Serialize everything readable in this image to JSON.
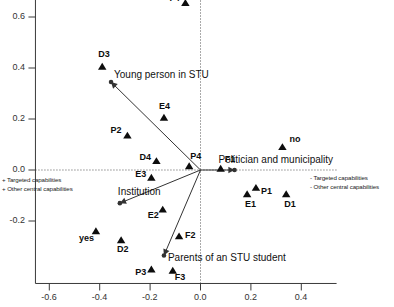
{
  "chart_data": {
    "type": "scatter",
    "title": "",
    "xlabel": "'Whom is in focus' and discourse on capabilities",
    "ylabel": "",
    "xlim": [
      -0.72,
      0.56
    ],
    "ylim": [
      -0.32,
      0.72
    ],
    "xticks": [
      -0.6,
      -0.4,
      -0.2,
      0.0,
      0.2,
      0.4
    ],
    "xtick_labels": [
      "-0.6",
      "-0.4",
      "-0.2",
      "0.0",
      "0.2",
      "0.4"
    ],
    "yticks": [
      0.6,
      0.4,
      0.2,
      0.0,
      -0.2
    ],
    "ytick_labels": [
      "0.6",
      "0.4",
      "0.2",
      "0.0",
      "-0.2"
    ],
    "grid": false,
    "reference_lines": {
      "x": 0.0,
      "y": 0.0,
      "style": "dotted"
    },
    "marker": "triangle",
    "points": [
      {
        "label": "F4",
        "x": -0.06,
        "y": 0.655,
        "label_dx": -16,
        "label_dy": -5
      },
      {
        "label": "D3",
        "x": -0.39,
        "y": 0.405,
        "label_dx": -4,
        "label_dy": -13
      },
      {
        "label": "E4",
        "x": -0.145,
        "y": 0.205,
        "label_dx": -5,
        "label_dy": -12
      },
      {
        "label": "P2",
        "x": -0.29,
        "y": 0.135,
        "label_dx": -17,
        "label_dy": -6
      },
      {
        "label": "no",
        "x": 0.325,
        "y": 0.09,
        "label_dx": 7,
        "label_dy": -8
      },
      {
        "label": "D4",
        "x": -0.175,
        "y": 0.035,
        "label_dx": -17,
        "label_dy": -4
      },
      {
        "label": "P4",
        "x": -0.045,
        "y": 0.015,
        "label_dx": 1,
        "label_dy": -10
      },
      {
        "label": "F1",
        "x": 0.08,
        "y": 0.005,
        "label_dx": 4,
        "label_dy": -10
      },
      {
        "label": "E3",
        "x": -0.195,
        "y": -0.03,
        "label_dx": -16,
        "label_dy": -4
      },
      {
        "label": "E2",
        "x": -0.15,
        "y": -0.155,
        "label_dx": -15,
        "label_dy": 5
      },
      {
        "label": "P1",
        "x": 0.22,
        "y": -0.07,
        "label_dx": 5,
        "label_dy": 3
      },
      {
        "label": "E1",
        "x": 0.185,
        "y": -0.095,
        "label_dx": -2,
        "label_dy": 10
      },
      {
        "label": "D1",
        "x": 0.34,
        "y": -0.095,
        "label_dx": -2,
        "label_dy": 10
      },
      {
        "label": "F2",
        "x": -0.085,
        "y": -0.26,
        "label_dx": 6,
        "label_dy": -1
      },
      {
        "label": "yes",
        "x": -0.415,
        "y": -0.24,
        "label_dx": -17,
        "label_dy": 7
      },
      {
        "label": "D2",
        "x": -0.315,
        "y": -0.275,
        "label_dx": -4,
        "label_dy": 9
      },
      {
        "label": "P3",
        "x": -0.195,
        "y": -0.39,
        "label_dx": -16,
        "label_dy": 3
      },
      {
        "label": "F3",
        "x": -0.11,
        "y": -0.395,
        "label_dx": 2,
        "label_dy": 6
      }
    ],
    "vectors": [
      {
        "label": "Young person in STU",
        "tip_x": -0.355,
        "tip_y": 0.345,
        "label_dx": 3,
        "label_dy": -12
      },
      {
        "label": "Institution",
        "tip_x": -0.32,
        "tip_y": -0.13,
        "label_dx": -2,
        "label_dy": -16
      },
      {
        "label": "Politician and municipality",
        "tip_x": 0.135,
        "tip_y": 0.0,
        "label_dx": -16,
        "label_dy": -15
      },
      {
        "label": "Parents of an STU student",
        "tip_x": -0.145,
        "tip_y": -0.335,
        "label_dx": 4,
        "label_dy": -2
      }
    ],
    "annotations": {
      "left_legend": [
        "+ Targeted capabilities",
        "+ Other central capabilities"
      ],
      "right_legend": [
        "- Targeted capabilities",
        "- Other central capabilities"
      ]
    },
    "colors": {
      "marker": "#0d0d0d",
      "axis": "#3a3a3a",
      "reference_line": "#555555",
      "vector": "#333333",
      "background": "#ffffff"
    }
  }
}
